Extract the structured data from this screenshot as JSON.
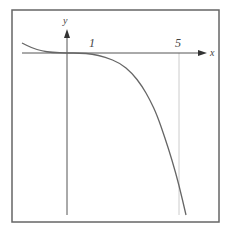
{
  "chart_data": {
    "type": "line",
    "title": "",
    "xlabel": "x",
    "ylabel": "y",
    "x_ticks": [
      {
        "value": 1,
        "label": "1"
      },
      {
        "value": 5,
        "label": "5"
      }
    ],
    "grid": false,
    "legend": null,
    "guides": [
      {
        "type": "vertical",
        "x": 5
      }
    ],
    "series": [
      {
        "name": "curve",
        "points_px": [
          [
            22,
            43
          ],
          [
            32,
            48
          ],
          [
            42,
            51
          ],
          [
            52,
            52.5
          ],
          [
            67,
            53
          ],
          [
            80,
            53
          ],
          [
            92,
            54
          ],
          [
            105,
            57
          ],
          [
            120,
            63
          ],
          [
            132,
            73
          ],
          [
            142,
            86
          ],
          [
            150,
            100
          ],
          [
            157,
            115
          ],
          [
            165,
            138
          ],
          [
            172,
            160
          ],
          [
            179,
            185
          ],
          [
            186,
            215
          ]
        ]
      }
    ],
    "colors": {
      "frame": "#666666",
      "axis": "#555555",
      "curve": "#666666",
      "guide": "#cccccc",
      "text": "#444444"
    }
  }
}
